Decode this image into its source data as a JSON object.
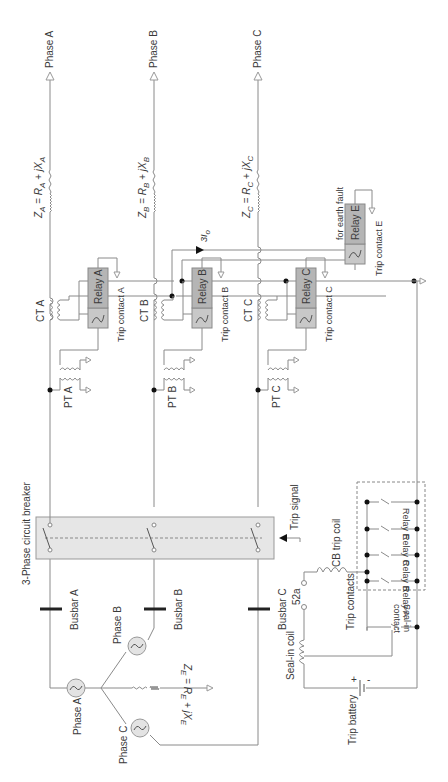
{
  "diagram": {
    "orientation": "rotated-90-ccw",
    "phases": [
      {
        "id": "A",
        "output_label": "Phase A",
        "impedance": {
          "Z": "Z",
          "sub": "A",
          "R": "R",
          "X": "X"
        },
        "ct_label": "CT A",
        "pt_label": "PT A",
        "relay_label": "Relay A",
        "trip_contact_label": "Trip contact A",
        "busbar_label": "Busbar A",
        "source_label": "Phase A"
      },
      {
        "id": "B",
        "output_label": "Phase B",
        "impedance": {
          "Z": "Z",
          "sub": "B",
          "R": "R",
          "X": "X"
        },
        "ct_label": "CT B",
        "pt_label": "PT B",
        "relay_label": "Relay B",
        "trip_contact_label": "Trip contact B",
        "busbar_label": "Busbar B",
        "source_label": "Phase B"
      },
      {
        "id": "C",
        "output_label": "Phase C",
        "impedance": {
          "Z": "Z",
          "sub": "C",
          "R": "R",
          "X": "X"
        },
        "ct_label": "CT C",
        "pt_label": "PT C",
        "relay_label": "Relay C",
        "trip_contact_label": "Trip contact C",
        "busbar_label": "Busbar C",
        "source_label": "Phase C"
      }
    ],
    "earth_relay": {
      "relay_label": "Relay E",
      "caption": "for earth fault",
      "trip_contact_label": "Trip contact E",
      "residual_current_label": "3I",
      "residual_current_sub": "o"
    },
    "earth_impedance": {
      "Z": "Z",
      "sub": "E",
      "R": "R",
      "X": "X"
    },
    "circuit_breaker": {
      "label": "3-Phase circuit breaker",
      "trip_signal_label": "Trip signal"
    },
    "trip_circuit": {
      "cb_trip_coil_label": "CB trip coil",
      "aux_contact_label": "52a",
      "trip_contacts_label": "Trip contacts",
      "contacts": [
        "Relay A",
        "Relay B",
        "Relay C",
        "Relay E"
      ],
      "seal_in_contact_label_line1": "Seal-in",
      "seal_in_contact_label_line2": "contact",
      "seal_in_coil_label": "Seal-in coil",
      "battery_label": "Trip battery",
      "battery_plus": "+",
      "battery_minus": "-"
    },
    "operator_symbols": {
      "eq": " = ",
      "plus": " + ",
      "j": "j"
    }
  }
}
